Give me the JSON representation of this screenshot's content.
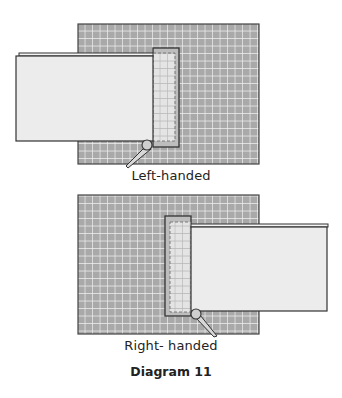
{
  "figure": {
    "caption": "Diagram 11",
    "panels": [
      {
        "id": "left",
        "label": "Left-handed",
        "board": {
          "x": 78,
          "y": 24,
          "w": 181,
          "h": 140
        },
        "paper": {
          "x": 16,
          "y": 56,
          "w": 137,
          "h": 85
        },
        "overlay": {
          "x": 153,
          "y": 48,
          "w": 26,
          "h": 99
        },
        "pin": {
          "cx": 147,
          "cy": 145,
          "r": 5,
          "handle_to_x": 127,
          "handle_to_y": 167
        }
      },
      {
        "id": "right",
        "label": "Right- handed",
        "board": {
          "x": 78,
          "y": 195,
          "w": 181,
          "h": 139
        },
        "paper": {
          "x": 191,
          "y": 227,
          "w": 136,
          "h": 84
        },
        "overlay": {
          "x": 165,
          "y": 216,
          "w": 26,
          "h": 100
        },
        "pin": {
          "cx": 196,
          "cy": 314,
          "r": 5,
          "handle_to_x": 217,
          "handle_to_y": 336
        }
      }
    ],
    "colors": {
      "board": "#a9a9a9",
      "grid_line": "#f2f2f2",
      "paper": "#ececec",
      "outline": "#333333",
      "overlay_fill": "#d6d6d6"
    }
  }
}
